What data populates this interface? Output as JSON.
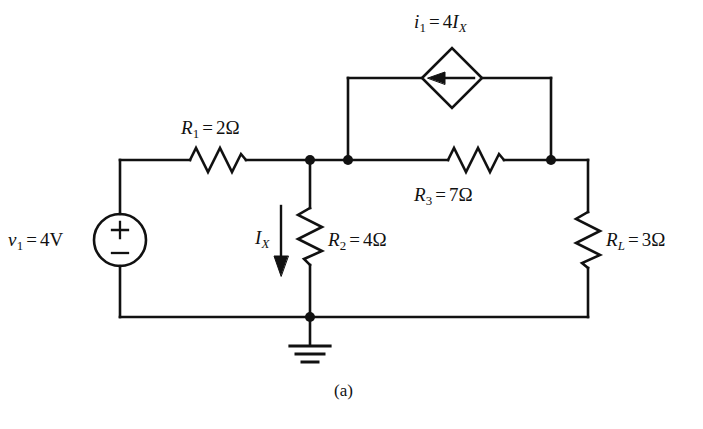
{
  "figure": {
    "caption": "(a)",
    "type": "electrical-circuit-schematic",
    "line_color": "#111111",
    "background_color": "#ffffff"
  },
  "labels": {
    "dependent_source": {
      "symbol": "i",
      "subscript": "1",
      "equals": "=",
      "value": "4",
      "control_symbol": "I",
      "control_subscript": "X",
      "full_text": "i1 = 4IX"
    },
    "r1": {
      "symbol": "R",
      "subscript": "1",
      "equals": "=",
      "value": "2Ω",
      "full_text": "R1 = 2Ω"
    },
    "r2": {
      "symbol": "R",
      "subscript": "2",
      "equals": "=",
      "value": "4Ω",
      "full_text": "R2 = 4Ω"
    },
    "r3": {
      "symbol": "R",
      "subscript": "3",
      "equals": "=",
      "value": "7Ω",
      "full_text": "R3 = 7Ω"
    },
    "rl": {
      "symbol": "R",
      "subscript": "L",
      "equals": "=",
      "value": "3Ω",
      "full_text": "RL = 3Ω"
    },
    "v1": {
      "symbol": "v",
      "subscript": "1",
      "equals": "=",
      "value": "4V",
      "full_text": "v1 = 4V"
    },
    "ix": {
      "symbol": "I",
      "subscript": "X",
      "full_text": "IX"
    },
    "source_plus": "+",
    "source_minus": "−"
  },
  "components": [
    {
      "name": "voltage-source-v1",
      "kind": "independent-voltage-source",
      "label": "v1 = 4V",
      "polarity_top": "+",
      "polarity_bottom": "−"
    },
    {
      "name": "resistor-r1",
      "kind": "resistor",
      "orientation": "horizontal",
      "label": "R1 = 2Ω",
      "value_ohms": 2
    },
    {
      "name": "resistor-r2",
      "kind": "resistor",
      "orientation": "vertical",
      "label": "R2 = 4Ω",
      "value_ohms": 4
    },
    {
      "name": "resistor-r3",
      "kind": "resistor",
      "orientation": "horizontal",
      "label": "R3 = 7Ω",
      "value_ohms": 7
    },
    {
      "name": "resistor-rl",
      "kind": "resistor",
      "orientation": "vertical",
      "label": "RL = 3Ω",
      "value_ohms": 3
    },
    {
      "name": "dependent-current-source-i1",
      "kind": "dependent-current-source",
      "label": "i1 = 4IX",
      "arrow_direction": "left"
    },
    {
      "name": "current-arrow-ix",
      "kind": "current-direction-arrow",
      "label": "IX",
      "arrow_direction": "down"
    },
    {
      "name": "ground-symbol",
      "kind": "ground",
      "label": ""
    }
  ]
}
